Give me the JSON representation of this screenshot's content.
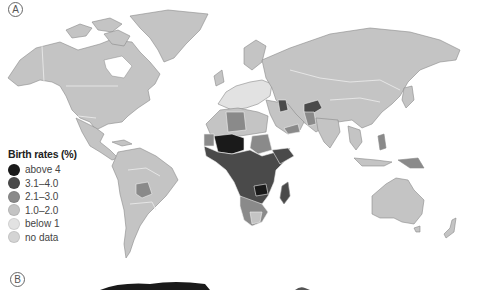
{
  "figure": {
    "panel_a_label": "A",
    "panel_b_label": "B"
  },
  "legend": {
    "title": "Birth rates (%)",
    "items": [
      {
        "label": "above 4",
        "color": "#1a1a1a"
      },
      {
        "label": "3.1–4.0",
        "color": "#4a4a4a"
      },
      {
        "label": "2.1–3.0",
        "color": "#8a8a8a"
      },
      {
        "label": "1.0–2.0",
        "color": "#c4c4c4"
      },
      {
        "label": "below 1",
        "color": "#e2e2e2"
      },
      {
        "label": "no data",
        "color": "#d4d4d4"
      }
    ]
  },
  "map": {
    "title": "World birth rates",
    "colors": {
      "ocean": "#ffffff",
      "land_default": "#c4c4c4",
      "border": "#eeeeee",
      "coast": "#8a8a8a"
    }
  }
}
